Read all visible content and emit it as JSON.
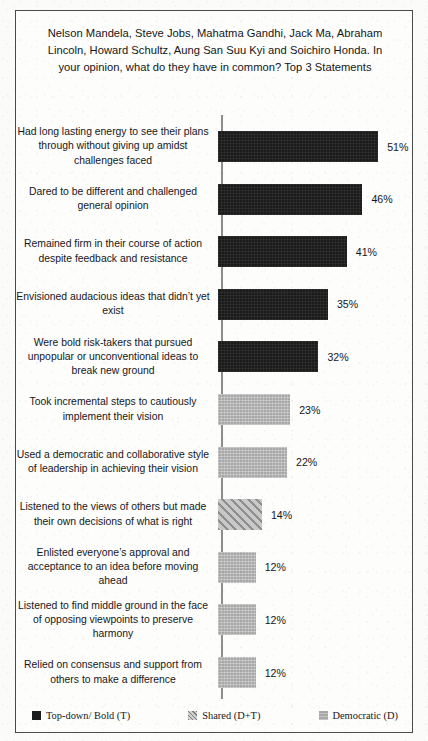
{
  "chart_data": {
    "type": "bar",
    "orientation": "horizontal",
    "title": "Nelson Mandela, Steve Jobs, Mahatma Gandhi, Jack Ma, Abraham Lincoln, Howard Schultz, Aung San Suu Kyi and Soichiro Honda. In your opinion, what do they have in common? Top 3 Statements",
    "xlabel": "",
    "ylabel": "",
    "xlim": [
      0,
      55
    ],
    "grid": false,
    "value_suffix": "%",
    "legend_position": "bottom",
    "categories": [
      "Had long lasting energy to see their plans through without giving up amidst challenges faced",
      "Dared to be different and challenged general opinion",
      "Remained firm in their course of action despite feedback and resistance",
      "Envisioned audacious  ideas that didn’t yet exist",
      "Were bold risk-takers that pursued unpopular or unconventional ideas to break new ground",
      "Took incremental steps to cautiously implement their vision",
      "Used a democratic and collaborative style of leadership  in achieving their vision",
      "Listened to the views of others but made their own decisions of what is right",
      "Enlisted everyone’s approval and acceptance to an idea before moving ahead",
      "Listened to find middle ground in the face of opposing viewpoints  to preserve harmony",
      "Relied on consensus and support from others to make a difference"
    ],
    "values": [
      51,
      46,
      41,
      35,
      32,
      23,
      22,
      14,
      12,
      12,
      12
    ],
    "value_labels": [
      "51%",
      "46%",
      "41%",
      "35%",
      "32%",
      "23%",
      "22%",
      "14%",
      "12%",
      "12%",
      "12%"
    ],
    "series_of_point": [
      "topdown",
      "topdown",
      "topdown",
      "topdown",
      "topdown",
      "democratic",
      "democratic",
      "shared",
      "democratic",
      "democratic",
      "democratic"
    ],
    "legend": [
      {
        "key": "topdown",
        "label": "Top-down/ Bold (T)",
        "color": "#1b1b1b"
      },
      {
        "key": "shared",
        "label": "Shared (D+T)",
        "color": "#c9c9c9"
      },
      {
        "key": "democratic",
        "label": "Democratic (D)",
        "color": "#a8a8a8"
      }
    ]
  }
}
